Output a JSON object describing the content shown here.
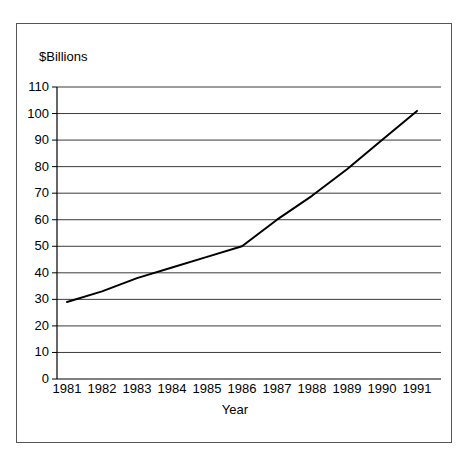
{
  "chart_data": {
    "type": "line",
    "title": "",
    "subtitle": "",
    "ylabel": "$Billions",
    "xlabel": "Year",
    "categories": [
      "1981",
      "1982",
      "1983",
      "1984",
      "1985",
      "1986",
      "1987",
      "1988",
      "1989",
      "1990",
      "1991"
    ],
    "x": [
      1981,
      1982,
      1983,
      1984,
      1985,
      1986,
      1987,
      1988,
      1989,
      1990,
      1991
    ],
    "series": [
      {
        "name": "",
        "values": [
          29,
          33,
          38,
          42,
          46,
          50,
          60,
          69,
          79,
          90,
          101
        ]
      }
    ],
    "ylim": [
      0,
      110
    ],
    "ytick_labels": [
      "110",
      "100",
      "90",
      "80",
      "70",
      "60",
      "50",
      "40",
      "30",
      "20",
      "10",
      "0"
    ],
    "ytick_values": [
      110,
      100,
      90,
      80,
      70,
      60,
      50,
      40,
      30,
      20,
      10,
      0
    ],
    "xtick_labels": [
      "1981",
      "1982",
      "1983",
      "1984",
      "1985",
      "1986",
      "1987",
      "1988",
      "1989",
      "1990",
      "1991"
    ],
    "grid": "horizontal",
    "legend": "none",
    "line_color": "#000000",
    "grid_color": "#3a3a3a",
    "axis_color": "#000000",
    "background_color": "#ffffff",
    "border_color": "#555555",
    "annotations": []
  }
}
